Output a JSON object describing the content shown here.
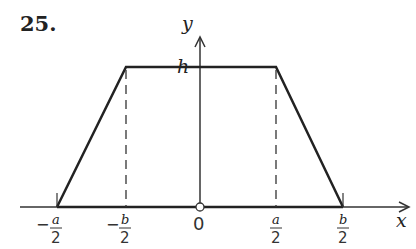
{
  "figure": {
    "number": "25.",
    "y_axis_label": "y",
    "x_axis_label": "x",
    "height_label": "h",
    "origin_label": "0",
    "ticks": [
      {
        "sign": "−",
        "num": "a",
        "den": "2"
      },
      {
        "sign": "−",
        "num": "b",
        "den": "2"
      },
      {
        "sign": "",
        "num": "a",
        "den": "2"
      },
      {
        "sign": "",
        "num": "b",
        "den": "2"
      }
    ]
  },
  "colors": {
    "line": "#222222",
    "background": "#ffffff"
  }
}
